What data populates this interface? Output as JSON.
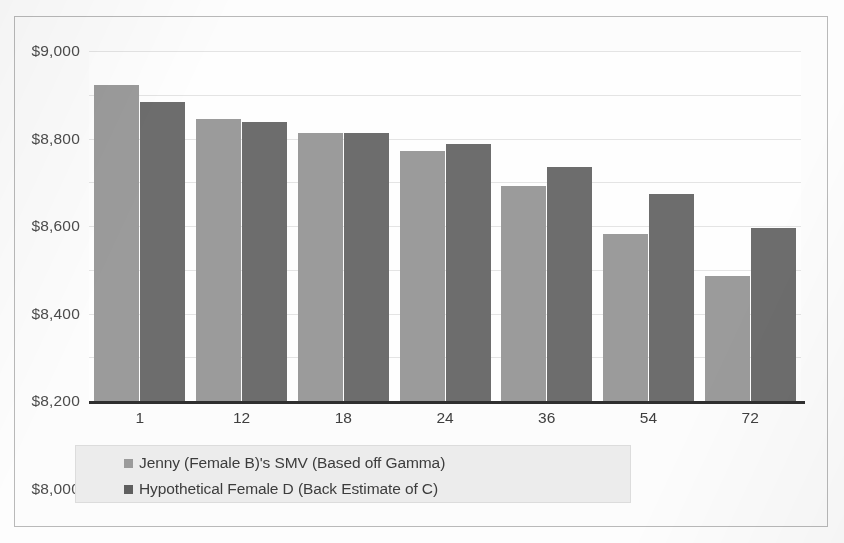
{
  "chart_data": {
    "type": "bar",
    "title": "",
    "subtitle": "",
    "xlabel": "",
    "ylabel": "",
    "categories": [
      "1",
      "12",
      "18",
      "24",
      "36",
      "54",
      "72"
    ],
    "series": [
      {
        "name": "Jenny (Female B)'s SMV (Based off Gamma)",
        "color": "#9b9b9b",
        "values": [
          8845,
          8690,
          8625,
          8545,
          8385,
          8165,
          7970
        ]
      },
      {
        "name": "Hypothetical Female D (Back Estimate of C)",
        "color": "#6d6d6d",
        "values": [
          8765,
          8675,
          8625,
          8575,
          8470,
          8345,
          8190
        ]
      }
    ],
    "ylim": [
      7400,
      9000
    ],
    "ytick_step": 200,
    "ytick_labels": [
      "$9,000",
      "$8,800",
      "$8,600",
      "$8,400",
      "$8,200",
      "$8,000",
      "$7,800",
      "$7,600",
      "$7,400"
    ],
    "ytick_values": [
      9000,
      8800,
      8600,
      8400,
      8200,
      8000,
      7800,
      7600,
      7400
    ],
    "grid": true,
    "legend_position": "bottom-left",
    "currency_prefix": "$"
  },
  "legend": {
    "entries": [
      {
        "label": "Jenny (Female B)'s SMV (Based off Gamma)"
      },
      {
        "label": "Hypothetical Female D (Back Estimate of C)"
      }
    ]
  }
}
